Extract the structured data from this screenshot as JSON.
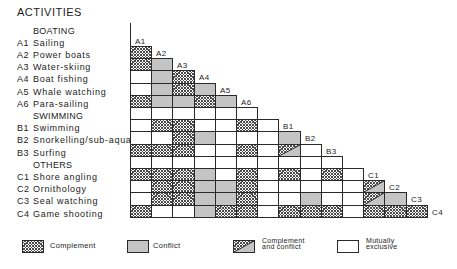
{
  "title": "ACTIVITIES",
  "groups": [
    {
      "name": "BOATING",
      "items": [
        {
          "code": "A1",
          "name": "Sailing"
        },
        {
          "code": "A2",
          "name": "Power boats"
        },
        {
          "code": "A3",
          "name": "Water-skiing"
        },
        {
          "code": "A4",
          "name": "Boat fishing"
        },
        {
          "code": "A5",
          "name": "Whale watching"
        },
        {
          "code": "A6",
          "name": "Para-sailing"
        }
      ]
    },
    {
      "name": "SWIMMING",
      "items": [
        {
          "code": "B1",
          "name": "Swimming"
        },
        {
          "code": "B2",
          "name": "Snorkelling/sub-aqua"
        },
        {
          "code": "B3",
          "name": "Surfing"
        }
      ]
    },
    {
      "name": "OTHERS",
      "items": [
        {
          "code": "C1",
          "name": "Shore angling"
        },
        {
          "code": "C2",
          "name": "Ornithology"
        },
        {
          "code": "C3",
          "name": "Seal watching"
        },
        {
          "code": "C4",
          "name": "Game shooting"
        }
      ]
    }
  ],
  "matrix": {
    "labels": [
      "A1",
      "A2",
      "A3",
      "A4",
      "A5",
      "A6",
      "",
      "B1",
      "B2",
      "B3",
      "",
      "C1",
      "C2",
      "C3",
      "C4"
    ],
    "rows": [
      [],
      [
        "complement"
      ],
      [
        "complement",
        "conflict"
      ],
      [
        "exclusive",
        "conflict",
        "complement"
      ],
      [
        "exclusive",
        "conflict",
        "complement",
        "conflict"
      ],
      [
        "complement",
        "conflict",
        "conflict",
        "complement",
        "conflict"
      ],
      [
        "blank",
        "blank",
        "blank",
        "blank",
        "blank",
        "blank"
      ],
      [
        "exclusive",
        "complement",
        "complement",
        "exclusive",
        "exclusive",
        "complement",
        "blank"
      ],
      [
        "exclusive",
        "exclusive",
        "complement",
        "conflict",
        "exclusive",
        "exclusive",
        "blank",
        "conflict"
      ],
      [
        "complement",
        "complement",
        "complement",
        "exclusive",
        "exclusive",
        "complement",
        "blank",
        "both",
        "exclusive"
      ],
      [
        "blank",
        "blank",
        "blank",
        "blank",
        "blank",
        "blank",
        "blank",
        "blank",
        "blank",
        "blank"
      ],
      [
        "complement",
        "complement",
        "complement",
        "conflict",
        "exclusive",
        "complement",
        "blank",
        "complement",
        "exclusive",
        "complement",
        "blank"
      ],
      [
        "exclusive",
        "complement",
        "complement",
        "conflict",
        "conflict",
        "complement",
        "blank",
        "exclusive",
        "exclusive",
        "exclusive",
        "blank",
        "both"
      ],
      [
        "exclusive",
        "complement",
        "complement",
        "conflict",
        "conflict",
        "complement",
        "blank",
        "exclusive",
        "conflict",
        "exclusive",
        "blank",
        "both",
        "conflict"
      ],
      [
        "complement",
        "exclusive",
        "exclusive",
        "conflict",
        "complement",
        "complement",
        "blank",
        "complement",
        "complement",
        "complement",
        "blank",
        "complement",
        "complement",
        "complement"
      ]
    ]
  },
  "legend": [
    {
      "key": "complement",
      "lines": [
        "Complement"
      ]
    },
    {
      "key": "conflict",
      "lines": [
        "Conflict"
      ]
    },
    {
      "key": "both",
      "lines": [
        "Complement",
        "and conflict"
      ]
    },
    {
      "key": "exclusive",
      "lines": [
        "Mutually",
        "exclusive"
      ]
    }
  ]
}
